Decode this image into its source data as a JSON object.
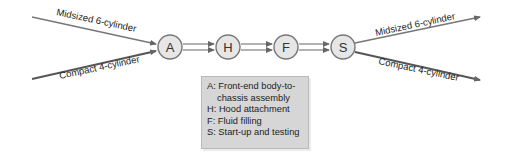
{
  "diagram": {
    "inputs": [
      {
        "label": "Midsized 6-cylinder"
      },
      {
        "label": "Compact 4-cylinder"
      }
    ],
    "outputs": [
      {
        "label": "Midsized 6-cylinder"
      },
      {
        "label": "Compact 4-cylinder"
      }
    ],
    "stations": [
      {
        "id": "A"
      },
      {
        "id": "H"
      },
      {
        "id": "F"
      },
      {
        "id": "S"
      }
    ],
    "legend": {
      "rows": [
        "A: Front-end body-to-",
        "chassis assembly",
        "H: Hood attachment",
        "F: Fluid filling",
        "S: Start-up and testing"
      ]
    },
    "colors": {
      "line": "#666666",
      "node_fill": "#e6e6e6",
      "node_stroke": "#777777",
      "legend_bg": "#d6d6d6"
    }
  }
}
